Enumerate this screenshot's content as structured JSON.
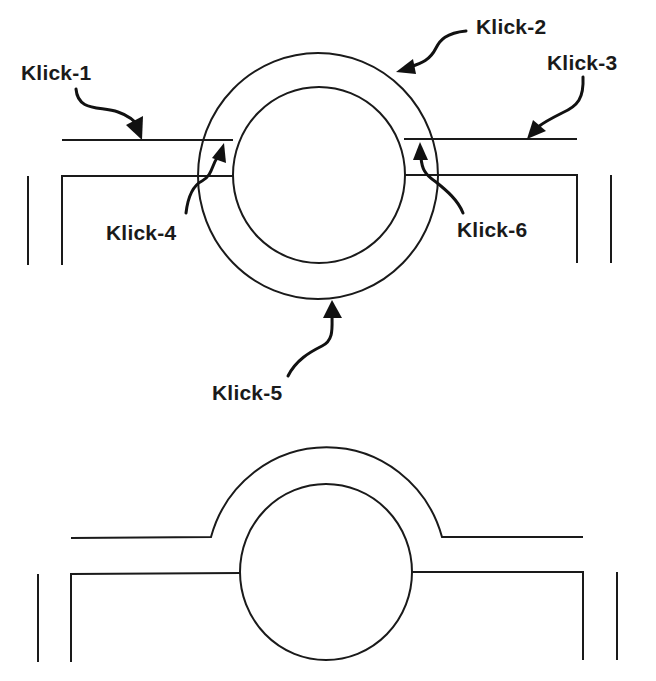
{
  "diagram": {
    "type": "cross-section schematic",
    "colors": {
      "line": "#1a1a1a",
      "background": "#ffffff"
    },
    "top_figure": {
      "description": "Pipe ring (outer and inner circle) passing between two parallel horizontal wall lines, with labelled click points",
      "labels": [
        {
          "id": "klick-1",
          "text": "Klick-1"
        },
        {
          "id": "klick-2",
          "text": "Klick-2"
        },
        {
          "id": "klick-3",
          "text": "Klick-3"
        },
        {
          "id": "klick-4",
          "text": "Klick-4"
        },
        {
          "id": "klick-5",
          "text": "Klick-5"
        },
        {
          "id": "klick-6",
          "text": "Klick-6"
        }
      ]
    },
    "bottom_figure": {
      "description": "Result: upper wall line bends over the ring as an arch; lower wall line meets the inner circle"
    }
  }
}
